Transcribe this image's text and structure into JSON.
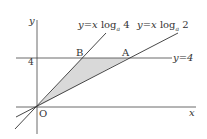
{
  "diagram": {
    "axes": {
      "x_label": "x",
      "y_label": "y",
      "origin_label": "O",
      "y_tick": "4"
    },
    "lines": [
      {
        "label_y": "y",
        "eq": "=",
        "label_x": "x",
        "log": "log",
        "base": "a",
        "arg": "4"
      },
      {
        "label_y": "y",
        "eq": "=",
        "label_x": "x",
        "log": "log",
        "base": "a",
        "arg": "2"
      },
      {
        "label": "y=4"
      }
    ],
    "points": {
      "B": "B",
      "A": "A"
    },
    "shading": "#d9d9d9",
    "line_color": "#333333"
  }
}
